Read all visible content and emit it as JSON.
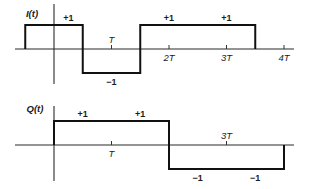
{
  "figure": {
    "panels": [
      {
        "id": "I",
        "ylabel": "I(t)",
        "segments": [
          {
            "from": -0.5,
            "to": 0.5,
            "value": 1
          },
          {
            "from": 0.5,
            "to": 1.5,
            "value": -1
          },
          {
            "from": 1.5,
            "to": 3.5,
            "value": 1
          }
        ],
        "level_labels": [
          {
            "t": 0.25,
            "text": "+1"
          },
          {
            "t": 1.0,
            "text": "−1"
          },
          {
            "t": 2.0,
            "text": "+1"
          },
          {
            "t": 3.0,
            "text": "+1"
          }
        ],
        "ticks": [
          {
            "t": 1,
            "text": "T",
            "side": "above"
          },
          {
            "t": 2,
            "text": "2T",
            "side": "below"
          },
          {
            "t": 3,
            "text": "3T",
            "side": "below"
          },
          {
            "t": 4,
            "text": "4T",
            "side": "below"
          }
        ]
      },
      {
        "id": "Q",
        "ylabel": "Q(t)",
        "segments": [
          {
            "from": 0,
            "to": 2,
            "value": 1
          },
          {
            "from": 2,
            "to": 4,
            "value": -1
          }
        ],
        "level_labels": [
          {
            "t": 0.5,
            "text": "+1"
          },
          {
            "t": 1.5,
            "text": "+1"
          },
          {
            "t": 2.5,
            "text": "−1"
          },
          {
            "t": 3.5,
            "text": "−1"
          }
        ],
        "ticks": [
          {
            "t": 1,
            "text": "T",
            "side": "below"
          },
          {
            "t": 3,
            "text": "3T",
            "side": "above"
          }
        ]
      }
    ],
    "time_unit": "T",
    "t_range": [
      -0.7,
      4.2
    ]
  }
}
